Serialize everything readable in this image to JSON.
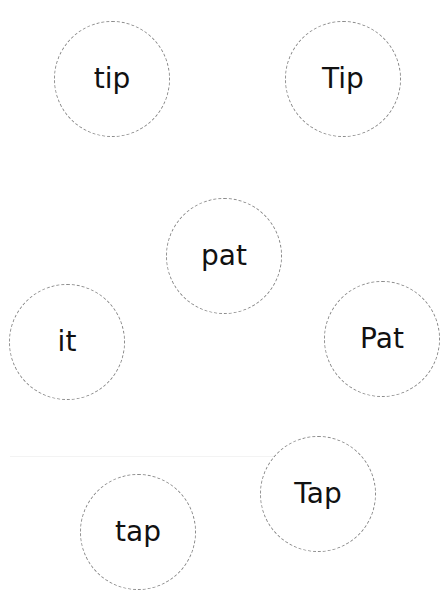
{
  "worksheet": {
    "words": [
      {
        "text": "tip",
        "cx": 112,
        "cy": 79,
        "r": 58
      },
      {
        "text": "Tip",
        "cx": 343,
        "cy": 79,
        "r": 58
      },
      {
        "text": "pat",
        "cx": 224,
        "cy": 256,
        "r": 58
      },
      {
        "text": "it",
        "cx": 67,
        "cy": 342,
        "r": 58
      },
      {
        "text": "Pat",
        "cx": 382,
        "cy": 339,
        "r": 58
      },
      {
        "text": "Tap",
        "cx": 318,
        "cy": 494,
        "r": 58
      },
      {
        "text": "tap",
        "cx": 138,
        "cy": 535,
        "r": 58
      }
    ],
    "circle_border_color": "#8a8a8a",
    "text_color": "#111111"
  }
}
